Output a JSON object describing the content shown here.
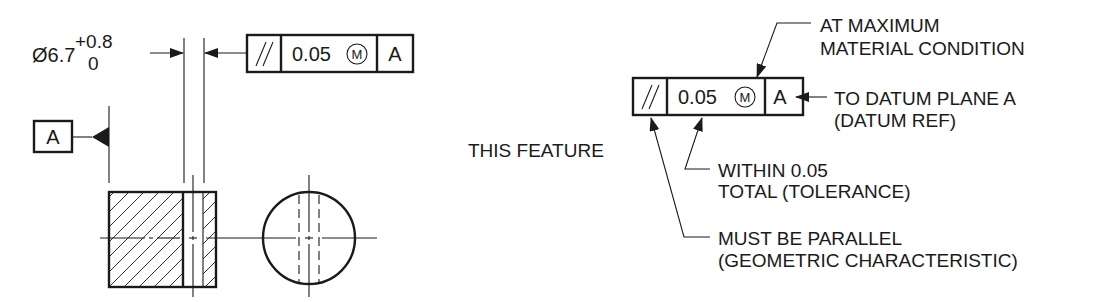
{
  "left_view": {
    "dimension": {
      "nominal": "Ø6.7",
      "upper_tol": "+0.8",
      "lower_tol": "0"
    },
    "feature_control_frame": {
      "symbol": "//",
      "tolerance": "0.05",
      "modifier": "M",
      "datum": "A"
    },
    "datum_feature": {
      "label": "A"
    }
  },
  "right_view": {
    "feature_control_frame": {
      "symbol": "//",
      "tolerance": "0.05",
      "modifier": "M",
      "datum": "A"
    },
    "callouts": {
      "mmc_line1": "AT MAXIMUM",
      "mmc_line2": "MATERIAL CONDITION",
      "datum_line1": "TO DATUM PLANE A",
      "datum_line2": "(DATUM REF)",
      "this_feature": "THIS FEATURE",
      "tolerance_line1": "WITHIN 0.05",
      "tolerance_line2": "TOTAL (TOLERANCE)",
      "geometric_line1": "MUST BE PARALLEL",
      "geometric_line2": "(GEOMETRIC CHARACTERISTIC)"
    }
  },
  "colors": {
    "ink": "#1a1a1a",
    "background": "#ffffff"
  }
}
